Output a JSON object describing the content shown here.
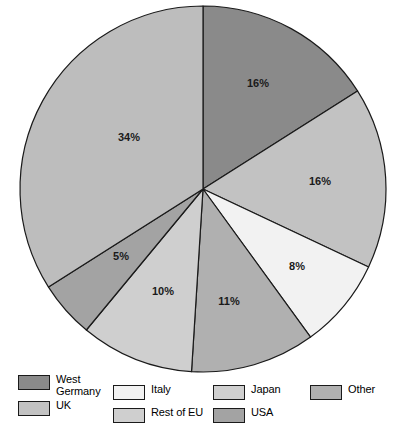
{
  "chart_data": {
    "type": "pie",
    "title": "",
    "labels": [
      "West Germany",
      "UK",
      "Italy",
      "USA",
      "Rest of EU",
      "Japan",
      "Other"
    ],
    "values": [
      16,
      16,
      8,
      11,
      10,
      5,
      34
    ],
    "value_labels": [
      "16%",
      "16%",
      "8%",
      "11%",
      "10%",
      "5%",
      "34%"
    ],
    "unit": "%",
    "start_angle_deg": 0,
    "direction": "clockwise",
    "legend_position": "bottom",
    "grid": false,
    "colors": [
      "#8a8a8a",
      "#c2c2c2",
      "#f2f2f2",
      "#b0b0b0",
      "#cfcfcf",
      "#a3a3a3",
      "#bdbdbd"
    ],
    "stroke_color": "#1a1a1a",
    "slices": [
      {
        "name": "West Germany",
        "value": 16,
        "label": "16%",
        "color": "#8a8a8a"
      },
      {
        "name": "UK",
        "value": 16,
        "label": "16%",
        "color": "#c2c2c2"
      },
      {
        "name": "Italy",
        "value": 8,
        "label": "8%",
        "color": "#f2f2f2"
      },
      {
        "name": "USA",
        "value": 11,
        "label": "11%",
        "color": "#b0b0b0"
      },
      {
        "name": "Rest of EU",
        "value": 10,
        "label": "10%",
        "color": "#cfcfcf"
      },
      {
        "name": "Japan",
        "value": 5,
        "label": "5%",
        "color": "#a3a3a3"
      },
      {
        "name": "Other",
        "value": 34,
        "label": "34%",
        "color": "#bdbdbd"
      }
    ]
  },
  "pie": {
    "center_x": 203,
    "center_y": 189,
    "radius": 183,
    "label_positions": [
      {
        "label": "16%",
        "x": 258,
        "y": 84
      },
      {
        "label": "16%",
        "x": 320,
        "y": 182
      },
      {
        "label": "8%",
        "x": 297,
        "y": 267
      },
      {
        "label": "11%",
        "x": 229,
        "y": 302
      },
      {
        "label": "10%",
        "x": 163,
        "y": 292
      },
      {
        "label": "5%",
        "x": 121,
        "y": 257
      },
      {
        "label": "34%",
        "x": 129,
        "y": 138
      }
    ]
  },
  "legend": {
    "entries": [
      {
        "key": "west-germany",
        "label": "West\nGermany",
        "color": "#8a8a8a",
        "x": 18,
        "y": 2
      },
      {
        "key": "uk",
        "label": "UK",
        "color": "#c2c2c2",
        "x": 18,
        "y": 28
      },
      {
        "key": "italy",
        "label": "Italy",
        "color": "#f2f2f2",
        "x": 113,
        "y": 12
      },
      {
        "key": "rest-of-eu",
        "label": "Rest of EU",
        "color": "#cfcfcf",
        "x": 113,
        "y": 35
      },
      {
        "key": "japan",
        "label": "Japan",
        "color": "#cfcfcf",
        "x": 213,
        "y": 12
      },
      {
        "key": "usa",
        "label": "USA",
        "color": "#a3a3a3",
        "x": 213,
        "y": 35
      },
      {
        "key": "other",
        "label": "Other",
        "color": "#b0b0b0",
        "x": 310,
        "y": 12
      }
    ]
  }
}
